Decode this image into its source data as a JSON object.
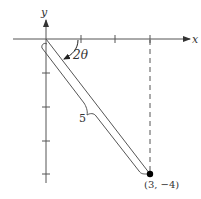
{
  "diagram": {
    "axes": {
      "x_label": "x",
      "y_label": "y",
      "x_ticks": [
        1,
        2,
        3
      ],
      "y_ticks": [
        -1,
        -2,
        -3,
        -4
      ]
    },
    "angle_label": "2θ",
    "segment_length_label": "5",
    "point": {
      "label": "(3, −4)",
      "x": 3,
      "y": -4
    },
    "colors": {
      "stroke": "#555555",
      "point": "#000000",
      "background": "#ffffff"
    }
  }
}
